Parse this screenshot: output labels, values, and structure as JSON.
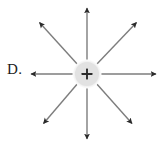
{
  "figure": {
    "label": "D.",
    "charge_symbol": "+",
    "charge_polarity": "positive",
    "charge_center": {
      "x": 87,
      "y": 74
    },
    "charge_radius": 13,
    "charge_fill": "#e2e2e2",
    "charge_halo_fill": "#efefef",
    "line_color": "#7d7d7d",
    "arrowhead_color": "#2b2b2b",
    "background": "#ffffff",
    "line_width": 1.4,
    "arrow_count": 8,
    "arrows": [
      {
        "name": "arrow-up",
        "direction": "up",
        "angle_deg": 90,
        "tip": {
          "x": 87,
          "y": 6
        }
      },
      {
        "name": "arrow-up-right",
        "direction": "up-right",
        "angle_deg": 45,
        "tip": {
          "x": 139,
          "y": 20
        }
      },
      {
        "name": "arrow-right",
        "direction": "right",
        "angle_deg": 0,
        "tip": {
          "x": 159,
          "y": 74
        }
      },
      {
        "name": "arrow-down-right",
        "direction": "down-right",
        "angle_deg": -45,
        "tip": {
          "x": 134,
          "y": 126
        }
      },
      {
        "name": "arrow-down",
        "direction": "down",
        "angle_deg": -90,
        "tip": {
          "x": 87,
          "y": 141
        }
      },
      {
        "name": "arrow-down-left",
        "direction": "down-left",
        "angle_deg": -135,
        "tip": {
          "x": 41,
          "y": 126
        }
      },
      {
        "name": "arrow-left",
        "direction": "left",
        "angle_deg": 180,
        "tip": {
          "x": 28,
          "y": 74
        }
      },
      {
        "name": "arrow-up-left",
        "direction": "up-left",
        "angle_deg": 135,
        "tip": {
          "x": 37,
          "y": 20
        }
      }
    ]
  }
}
